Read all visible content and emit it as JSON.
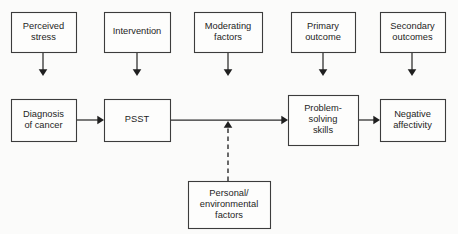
{
  "diagram": {
    "background_color": "#fbfbfa",
    "box_fill": "#fdfdfc",
    "box_stroke": "#3c3c3c",
    "connector_color": "#2b2b2b",
    "header_row": {
      "boxes": [
        {
          "id": "perceived-stress",
          "lines": [
            "Perceived",
            "stress"
          ],
          "x": 11,
          "y": 12,
          "w": 65,
          "h": 40
        },
        {
          "id": "intervention",
          "lines": [
            "Intervention"
          ],
          "x": 104,
          "y": 12,
          "w": 66,
          "h": 40
        },
        {
          "id": "moderating-factors",
          "lines": [
            "Moderating",
            "factors"
          ],
          "x": 194,
          "y": 12,
          "w": 68,
          "h": 40
        },
        {
          "id": "primary-outcome",
          "lines": [
            "Primary",
            "outcome"
          ],
          "x": 291,
          "y": 12,
          "w": 64,
          "h": 40
        },
        {
          "id": "secondary-outcomes",
          "lines": [
            "Secondary",
            "outcomes"
          ],
          "x": 380,
          "y": 12,
          "w": 65,
          "h": 40
        }
      ]
    },
    "flow_row": {
      "boxes": [
        {
          "id": "diagnosis-of-cancer",
          "lines": [
            "Diagnosis",
            "of cancer"
          ],
          "x": 11,
          "y": 99,
          "w": 65,
          "h": 42
        },
        {
          "id": "psst",
          "lines": [
            "PSST"
          ],
          "x": 104,
          "y": 99,
          "w": 66,
          "h": 42
        },
        {
          "id": "problem-solving-skills",
          "lines": [
            "Problem-",
            "solving",
            "skills"
          ],
          "x": 288,
          "y": 95,
          "w": 70,
          "h": 50
        },
        {
          "id": "negative-affectivity",
          "lines": [
            "Negative",
            "affectivity"
          ],
          "x": 380,
          "y": 99,
          "w": 65,
          "h": 42
        }
      ]
    },
    "moderator_row": {
      "boxes": [
        {
          "id": "personal-environmental-factors",
          "lines": [
            "Personal/",
            "environmental",
            "factors"
          ],
          "x": 188,
          "y": 181,
          "w": 82,
          "h": 47
        }
      ]
    },
    "connectors": [
      {
        "id": "perceived-stress-to-diagnosis",
        "style": "solid",
        "orientation": "vertical",
        "x1": 43,
        "y1": 52,
        "x2": 43,
        "y2": 76
      },
      {
        "id": "intervention-to-psst",
        "style": "solid",
        "orientation": "vertical",
        "x1": 137,
        "y1": 52,
        "x2": 137,
        "y2": 76
      },
      {
        "id": "moderating-factors-to-flow",
        "style": "solid",
        "orientation": "vertical",
        "x1": 228,
        "y1": 52,
        "x2": 228,
        "y2": 76
      },
      {
        "id": "primary-outcome-to-problem-solving",
        "style": "solid",
        "orientation": "vertical",
        "x1": 323,
        "y1": 52,
        "x2": 323,
        "y2": 76
      },
      {
        "id": "secondary-outcomes-to-negative-affectivity",
        "style": "solid",
        "orientation": "vertical",
        "x1": 412,
        "y1": 52,
        "x2": 412,
        "y2": 76
      },
      {
        "id": "diagnosis-to-psst",
        "style": "solid",
        "orientation": "horizontal",
        "x1": 76,
        "y1": 120,
        "x2": 104,
        "y2": 120
      },
      {
        "id": "psst-to-problem-solving",
        "style": "solid",
        "orientation": "horizontal",
        "x1": 170,
        "y1": 120,
        "x2": 288,
        "y2": 120
      },
      {
        "id": "problem-solving-to-negative-affectivity",
        "style": "solid",
        "orientation": "horizontal",
        "x1": 358,
        "y1": 120,
        "x2": 380,
        "y2": 120
      },
      {
        "id": "personal-factors-to-flow",
        "style": "dashed",
        "orientation": "vertical-up",
        "x1": 228,
        "y1": 181,
        "x2": 228,
        "y2": 121
      }
    ]
  }
}
